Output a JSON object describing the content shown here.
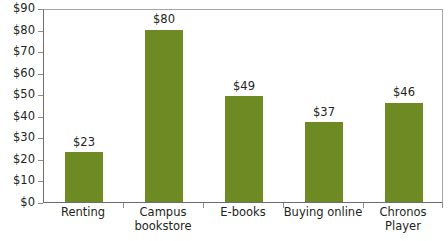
{
  "chart_data": {
    "type": "bar",
    "title": "",
    "subtitle": "",
    "xlabel": "",
    "ylabel": "",
    "categories": [
      "Renting",
      "Campus\nbookstore",
      "E-books",
      "Buying online",
      "Chronos Player"
    ],
    "values": [
      23,
      80,
      49,
      37,
      46
    ],
    "data_labels": [
      "$23",
      "$80",
      "$49",
      "$37",
      "$46"
    ],
    "ylim": [
      0,
      90
    ],
    "ytick_values": [
      90,
      80,
      70,
      60,
      50,
      40,
      30,
      20,
      10,
      0
    ],
    "ytick_labels": [
      "$90",
      "$80",
      "$70",
      "$60",
      "$50",
      "$40",
      "$30",
      "$20",
      "$10",
      "$0"
    ],
    "grid": false,
    "legend": null,
    "legend_position": "none",
    "series_color": "#6d8b22",
    "axis_color": "#6d6d6d",
    "frame_color": "#a6a6a6",
    "text_color": "#231f20",
    "background": "#ffffff"
  }
}
